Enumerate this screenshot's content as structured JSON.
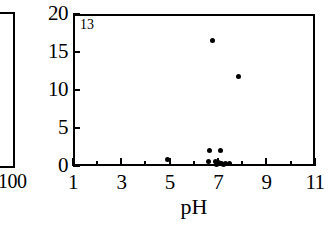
{
  "figure": {
    "panel_id": "13"
  },
  "left_partial_panel": {
    "name": "adjacent-panel-fragment",
    "x_axis_last_tick_label": "100"
  },
  "chart_data": {
    "type": "scatter",
    "title": "",
    "subtitle": "",
    "panel_label": "13",
    "xlabel": "pH",
    "ylabel": "",
    "xlim": [
      1,
      11
    ],
    "ylim": [
      0,
      20
    ],
    "grid": false,
    "legend": null,
    "x_major_ticks": [
      1,
      3,
      5,
      7,
      9,
      11
    ],
    "x_minor_ticks": [
      2,
      4,
      6,
      8,
      10
    ],
    "x_tick_labels": [
      "1",
      "3",
      "5",
      "7",
      "9",
      "11"
    ],
    "y_ticks": [
      0,
      5,
      10,
      15,
      20
    ],
    "y_tick_labels": [
      "0",
      "5",
      "10",
      "15",
      "20"
    ],
    "marker": "filled-circle",
    "marker_color": "#000000",
    "points": [
      {
        "x": 6.75,
        "y": 16.5
      },
      {
        "x": 7.85,
        "y": 11.8
      },
      {
        "x": 6.65,
        "y": 2.1
      },
      {
        "x": 7.1,
        "y": 2.1
      },
      {
        "x": 4.9,
        "y": 0.85
      },
      {
        "x": 6.6,
        "y": 0.65
      },
      {
        "x": 6.9,
        "y": 0.55
      },
      {
        "x": 7.0,
        "y": 0.5
      },
      {
        "x": 7.05,
        "y": 0.3
      },
      {
        "x": 7.15,
        "y": 0.3
      },
      {
        "x": 7.3,
        "y": 0.3
      },
      {
        "x": 7.45,
        "y": 0.3
      },
      {
        "x": 6.95,
        "y": 0.15
      },
      {
        "x": 7.2,
        "y": 0.15
      }
    ]
  }
}
